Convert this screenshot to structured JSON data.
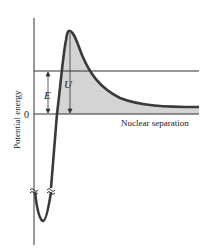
{
  "diagram": {
    "y_axis_label": "Potential energy",
    "x_axis_label": "Nuclear separation",
    "zero_label": "0",
    "energy_label": "E",
    "barrier_label": "U",
    "colors": {
      "curve": "#3a3a3a",
      "fill": "#d4d4d4",
      "axis": "#333333",
      "energy_line": "#333333"
    }
  }
}
